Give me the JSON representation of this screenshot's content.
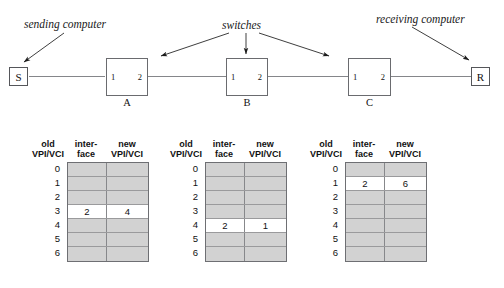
{
  "diagram": {
    "callouts": [
      {
        "id": "sending-computer",
        "text": "sending computer"
      },
      {
        "id": "switches",
        "text": "switches"
      },
      {
        "id": "receiving-computer",
        "text": "receiving computer"
      }
    ],
    "endpoints": [
      {
        "id": "sender",
        "label": "S"
      },
      {
        "id": "receiver",
        "label": "R"
      }
    ],
    "switches": [
      {
        "id": "switch-a",
        "label": "A",
        "port_left": "1",
        "port_right": "2"
      },
      {
        "id": "switch-b",
        "label": "B",
        "port_left": "1",
        "port_right": "2"
      },
      {
        "id": "switch-c",
        "label": "C",
        "port_left": "1",
        "port_right": "2"
      }
    ],
    "line_color": "#85868a",
    "box_border_color": "#6a6b6f"
  },
  "tables": {
    "headers": {
      "old": "old\nVPI/VCI",
      "interface": "inter-\nface",
      "new": "new\nVPI/VCI"
    },
    "row_labels": [
      "0",
      "1",
      "2",
      "3",
      "4",
      "5",
      "6"
    ],
    "colors": {
      "empty_row": "#d2d2d2",
      "filled_row": "#ffffff",
      "border": "#6e6f73"
    },
    "instances": [
      {
        "id": "table-a",
        "switch": "A",
        "rows": [
          {
            "old": "0",
            "interface": "",
            "new": ""
          },
          {
            "old": "1",
            "interface": "",
            "new": ""
          },
          {
            "old": "2",
            "interface": "",
            "new": ""
          },
          {
            "old": "3",
            "interface": "2",
            "new": "4"
          },
          {
            "old": "4",
            "interface": "",
            "new": ""
          },
          {
            "old": "5",
            "interface": "",
            "new": ""
          },
          {
            "old": "6",
            "interface": "",
            "new": ""
          }
        ]
      },
      {
        "id": "table-b",
        "switch": "B",
        "rows": [
          {
            "old": "0",
            "interface": "",
            "new": ""
          },
          {
            "old": "1",
            "interface": "",
            "new": ""
          },
          {
            "old": "2",
            "interface": "",
            "new": ""
          },
          {
            "old": "3",
            "interface": "",
            "new": ""
          },
          {
            "old": "4",
            "interface": "2",
            "new": "1"
          },
          {
            "old": "5",
            "interface": "",
            "new": ""
          },
          {
            "old": "6",
            "interface": "",
            "new": ""
          }
        ]
      },
      {
        "id": "table-c",
        "switch": "C",
        "rows": [
          {
            "old": "0",
            "interface": "",
            "new": ""
          },
          {
            "old": "1",
            "interface": "2",
            "new": "6"
          },
          {
            "old": "2",
            "interface": "",
            "new": ""
          },
          {
            "old": "3",
            "interface": "",
            "new": ""
          },
          {
            "old": "4",
            "interface": "",
            "new": ""
          },
          {
            "old": "5",
            "interface": "",
            "new": ""
          },
          {
            "old": "6",
            "interface": "",
            "new": ""
          }
        ]
      }
    ]
  }
}
